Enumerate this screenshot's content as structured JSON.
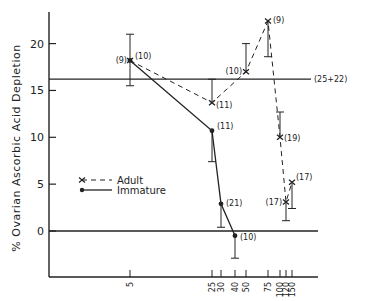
{
  "chart_data": {
    "type": "line",
    "title": "",
    "xlabel": "",
    "ylabel": "% Ovarian Ascorbic Acid Depletion",
    "ylim": [
      -5,
      24
    ],
    "x_ticks": [
      5,
      25,
      30,
      40,
      50,
      75,
      100,
      120,
      150
    ],
    "y_ticks": [
      0,
      5,
      10,
      15,
      20
    ],
    "grid": false,
    "reference_lines": [
      {
        "y": 16.2,
        "label": "(25+22)"
      },
      {
        "y": 0,
        "label": ""
      }
    ],
    "legend": {
      "position": "center-left",
      "entries": [
        "Adult",
        "Immature"
      ]
    },
    "series": [
      {
        "name": "Adult",
        "style": "dashed",
        "marker": "x",
        "points": [
          {
            "x": 5,
            "y": 18.2,
            "n": "(9)",
            "err_low": 15.5,
            "err_high": 21.0
          },
          {
            "x": 25,
            "y": 13.7,
            "n": "(11)",
            "err_low": 13.7,
            "err_high": 16.2
          },
          {
            "x": 50,
            "y": 17.0,
            "n": "(10)",
            "err_low": 17.0,
            "err_high": 20.0
          },
          {
            "x": 75,
            "y": 22.4,
            "n": "(9)",
            "err_low": 18.6,
            "err_high": 22.4
          },
          {
            "x": 100,
            "y": 10.0,
            "n": "(19)",
            "err_low": 10.0,
            "err_high": 12.7
          },
          {
            "x": 120,
            "y": 3.1,
            "n": "(17)",
            "err_low": 1.1,
            "err_high": 3.1
          },
          {
            "x": 150,
            "y": 5.2,
            "n": "(17)",
            "err_low": 2.4,
            "err_high": 5.2
          }
        ]
      },
      {
        "name": "Immature",
        "style": "solid",
        "marker": "dot",
        "points": [
          {
            "x": 5,
            "y": 18.2,
            "n": "(10)",
            "err_low": 15.5,
            "err_high": 21.0
          },
          {
            "x": 25,
            "y": 10.7,
            "n": "(11)",
            "err_low": 7.4,
            "err_high": 10.7
          },
          {
            "x": 30,
            "y": 2.9,
            "n": "(21)",
            "err_low": 0.4,
            "err_high": 2.9
          },
          {
            "x": 40,
            "y": -0.5,
            "n": "(10)",
            "err_low": -2.9,
            "err_high": -0.5
          }
        ]
      }
    ]
  }
}
